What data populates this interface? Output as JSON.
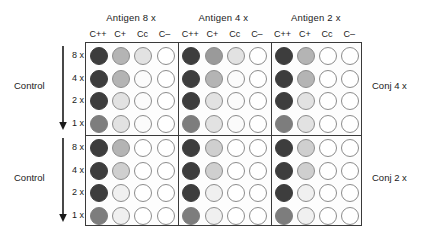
{
  "figure": {
    "width": 440,
    "height": 242
  },
  "antigen_groups": [
    {
      "id": "antigen-8x",
      "label": "Antigen 8 x"
    },
    {
      "id": "antigen-4x",
      "label": "Antigen 4 x"
    },
    {
      "id": "antigen-2x",
      "label": "Antigen 2 x"
    }
  ],
  "column_headers": [
    "C++",
    "C+",
    "Cc",
    "C–"
  ],
  "row_labels": [
    "8 x",
    "4 x",
    "2 x",
    "1 x"
  ],
  "left_labels": [
    {
      "id": "control-top",
      "label": "Control"
    },
    {
      "id": "control-bottom",
      "label": "Control"
    }
  ],
  "right_labels": [
    {
      "id": "conj-4x",
      "label": "Conj 4 x"
    },
    {
      "id": "conj-2x",
      "label": "Conj 2 x"
    }
  ],
  "palette": {
    "frame": "#3a3a3a",
    "well_stroke": "#8c8c8c",
    "background": "#ffffff",
    "text": "#1a1a1a",
    "shade_0": "#ffffff",
    "shade_1": "#fbfbfb",
    "shade_2": "#f0f0f0",
    "shade_3": "#e2e2e2",
    "shade_4": "#cfcfcf",
    "shade_5": "#b4b4b4",
    "shade_6": "#9a9a9a",
    "shade_7": "#7d7d7d",
    "shade_8": "#555555",
    "shade_9": "#3d3d3d"
  },
  "chart_data": {
    "type": "heatmap",
    "xlabel": "Conjugate control columns",
    "ylabel": "Serum dilution",
    "grid": true,
    "legend_position": "none",
    "categories": [
      "C++",
      "C+",
      "Cc",
      "C–"
    ],
    "rows": [
      "8 x",
      "4 x",
      "2 x",
      "1 x"
    ],
    "value_scale": {
      "min": 0,
      "max": 9,
      "description": "Gray intensity of each well: 0 = empty/white (no reaction), 9 = darkest (strong agglutination)"
    },
    "panels": [
      {
        "conjugate": "Conj 4 x",
        "antigen": "Antigen 8 x",
        "values": [
          [
            9,
            5,
            3,
            0
          ],
          [
            9,
            5,
            1,
            0
          ],
          [
            9,
            3,
            1,
            0
          ],
          [
            7,
            3,
            1,
            0
          ]
        ]
      },
      {
        "conjugate": "Conj 4 x",
        "antigen": "Antigen 4 x",
        "values": [
          [
            9,
            6,
            3,
            0
          ],
          [
            9,
            5,
            1,
            0
          ],
          [
            9,
            3,
            1,
            0
          ],
          [
            7,
            3,
            1,
            0
          ]
        ]
      },
      {
        "conjugate": "Conj 4 x",
        "antigen": "Antigen 2 x",
        "values": [
          [
            9,
            5,
            0,
            0
          ],
          [
            9,
            5,
            0,
            0
          ],
          [
            9,
            3,
            0,
            0
          ],
          [
            7,
            3,
            0,
            0
          ]
        ]
      },
      {
        "conjugate": "Conj 2 x",
        "antigen": "Antigen 8 x",
        "values": [
          [
            9,
            5,
            0,
            0
          ],
          [
            9,
            4,
            0,
            0
          ],
          [
            9,
            2,
            0,
            0
          ],
          [
            7,
            2,
            0,
            0
          ]
        ]
      },
      {
        "conjugate": "Conj 2 x",
        "antigen": "Antigen 4 x",
        "values": [
          [
            9,
            4,
            0,
            0
          ],
          [
            9,
            4,
            0,
            0
          ],
          [
            9,
            2,
            0,
            0
          ],
          [
            7,
            2,
            0,
            0
          ]
        ]
      },
      {
        "conjugate": "Conj 2 x",
        "antigen": "Antigen 2 x",
        "values": [
          [
            9,
            4,
            0,
            0
          ],
          [
            9,
            4,
            0,
            0
          ],
          [
            9,
            2,
            0,
            0
          ],
          [
            7,
            2,
            0,
            0
          ]
        ]
      }
    ]
  },
  "layout": {
    "plate": {
      "left": 85,
      "top": 42,
      "width": 277,
      "height": 184
    },
    "panel_width": 92.3,
    "panel_height": 92,
    "well_size": 18,
    "col_step": 22.2,
    "row_step": 22.5,
    "col_offset": 4,
    "row_offset": 4,
    "antigen_title_y": 12,
    "col_header_y": 29,
    "control_label_x": 14,
    "control_label_y_top": 80,
    "control_label_y_bottom": 172,
    "arrow_x": 57,
    "row_label_x": 62,
    "right_label_x": 372,
    "right_label_y_top": 80,
    "right_label_y_bottom": 172
  }
}
